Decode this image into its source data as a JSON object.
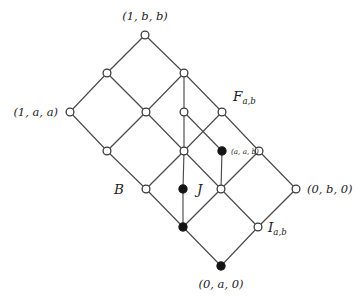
{
  "figure": {
    "type": "hasse-diagram",
    "title": "",
    "background_color": "#ffffff",
    "edge_color": "#4a4a4a",
    "open_node_fill": "#ffffff",
    "filled_node_fill": "#141414"
  },
  "nodes": [
    {
      "id": "n_top",
      "x": 145,
      "y": 35,
      "style": "open",
      "label": "(1, b, b)",
      "label_pos": "above"
    },
    {
      "id": "n_l1",
      "x": 107,
      "y": 73,
      "style": "open",
      "label": "",
      "label_pos": "none"
    },
    {
      "id": "n_c1",
      "x": 184,
      "y": 73,
      "style": "open",
      "label": "",
      "label_pos": "none"
    },
    {
      "id": "n_laa",
      "x": 70,
      "y": 112,
      "style": "open",
      "label": "(1, a, a)",
      "label_pos": "left"
    },
    {
      "id": "n_m1",
      "x": 146,
      "y": 112,
      "style": "open",
      "label": "",
      "label_pos": "none"
    },
    {
      "id": "n_m2",
      "x": 184,
      "y": 112,
      "style": "open",
      "label": "",
      "label_pos": "none"
    },
    {
      "id": "n_fab",
      "x": 222,
      "y": 112,
      "style": "open",
      "label": "",
      "label_pos": "none"
    },
    {
      "id": "n_m3",
      "x": 107,
      "y": 151,
      "style": "open",
      "label": "",
      "label_pos": "none"
    },
    {
      "id": "n_mid",
      "x": 184,
      "y": 151,
      "style": "open",
      "label": "",
      "label_pos": "none"
    },
    {
      "id": "n_aab",
      "x": 222,
      "y": 151,
      "style": "filled",
      "label": "(a, a, b)",
      "label_pos": "right-small"
    },
    {
      "id": "n_r1",
      "x": 259,
      "y": 151,
      "style": "open",
      "label": "",
      "label_pos": "none"
    },
    {
      "id": "n_b",
      "x": 146,
      "y": 189,
      "style": "open",
      "label": "",
      "label_pos": "none"
    },
    {
      "id": "n_j",
      "x": 183,
      "y": 189,
      "style": "filled",
      "label": "",
      "label_pos": "none"
    },
    {
      "id": "n_c2",
      "x": 221,
      "y": 189,
      "style": "open",
      "label": "",
      "label_pos": "none"
    },
    {
      "id": "n_0b0",
      "x": 296,
      "y": 189,
      "style": "open",
      "label": "(0, b, 0)",
      "label_pos": "right"
    },
    {
      "id": "n_low",
      "x": 183,
      "y": 227,
      "style": "filled",
      "label": "",
      "label_pos": "none"
    },
    {
      "id": "n_iab",
      "x": 258,
      "y": 227,
      "style": "open",
      "label": "",
      "label_pos": "none"
    },
    {
      "id": "n_bottom",
      "x": 221,
      "y": 266,
      "style": "filled",
      "label": "(0, a, 0)",
      "label_pos": "below"
    }
  ],
  "edges": [
    {
      "from": "n_laa",
      "to": "n_l1",
      "highlight": false
    },
    {
      "from": "n_l1",
      "to": "n_top",
      "highlight": false
    },
    {
      "from": "n_top",
      "to": "n_c1",
      "highlight": false
    },
    {
      "from": "n_l1",
      "to": "n_m1",
      "highlight": false
    },
    {
      "from": "n_c1",
      "to": "n_m2",
      "highlight": true
    },
    {
      "from": "n_c1",
      "to": "n_fab",
      "highlight": false
    },
    {
      "from": "n_c1",
      "to": "n_m1",
      "highlight": false
    },
    {
      "from": "n_laa",
      "to": "n_m3",
      "highlight": false
    },
    {
      "from": "n_m1",
      "to": "n_m3",
      "highlight": false
    },
    {
      "from": "n_m1",
      "to": "n_mid",
      "highlight": false
    },
    {
      "from": "n_m2",
      "to": "n_mid",
      "highlight": true
    },
    {
      "from": "n_m2",
      "to": "n_aab",
      "highlight": false
    },
    {
      "from": "n_fab",
      "to": "n_mid",
      "highlight": false
    },
    {
      "from": "n_fab",
      "to": "n_r1",
      "highlight": false
    },
    {
      "from": "n_m3",
      "to": "n_b",
      "highlight": false
    },
    {
      "from": "n_mid",
      "to": "n_b",
      "highlight": false
    },
    {
      "from": "n_mid",
      "to": "n_j",
      "highlight": true
    },
    {
      "from": "n_mid",
      "to": "n_c2",
      "highlight": false
    },
    {
      "from": "n_aab",
      "to": "n_c2",
      "highlight": false
    },
    {
      "from": "n_r1",
      "to": "n_c2",
      "highlight": false
    },
    {
      "from": "n_r1",
      "to": "n_0b0",
      "highlight": false
    },
    {
      "from": "n_b",
      "to": "n_low",
      "highlight": false
    },
    {
      "from": "n_j",
      "to": "n_low",
      "highlight": true
    },
    {
      "from": "n_c2",
      "to": "n_low",
      "highlight": false
    },
    {
      "from": "n_c2",
      "to": "n_iab",
      "highlight": false
    },
    {
      "from": "n_0b0",
      "to": "n_iab",
      "highlight": false
    },
    {
      "from": "n_low",
      "to": "n_bottom",
      "highlight": false
    },
    {
      "from": "n_iab",
      "to": "n_bottom",
      "highlight": false
    }
  ],
  "labels": {
    "top_node": {
      "text": "(1, b, b)",
      "x": 145,
      "y": 20,
      "anchor": "middle"
    },
    "left_node": {
      "text": "(1, a, a)",
      "x": 58,
      "y": 116,
      "anchor": "end"
    },
    "right_node": {
      "text": "(0, b, 0)",
      "x": 307,
      "y": 193,
      "anchor": "start"
    },
    "bottom_node": {
      "text": "(0, a, 0)",
      "x": 221,
      "y": 288,
      "anchor": "middle"
    },
    "aab_node": {
      "text": "(a, a, b)",
      "x": 231,
      "y": 154,
      "anchor": "start"
    }
  },
  "set_labels": [
    {
      "id": "label-F",
      "base": "F",
      "sub": "a,b",
      "x": 233,
      "y": 101,
      "anchor": "start"
    },
    {
      "id": "label-B",
      "base": "B",
      "sub": "",
      "x": 114,
      "y": 194,
      "anchor": "start"
    },
    {
      "id": "label-J",
      "base": "J",
      "sub": "",
      "x": 197,
      "y": 194,
      "anchor": "start"
    },
    {
      "id": "label-I",
      "base": "I",
      "sub": "a,b",
      "x": 268,
      "y": 232,
      "anchor": "start"
    }
  ]
}
